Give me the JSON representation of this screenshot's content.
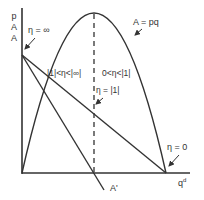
{
  "figure": {
    "type": "elasticity-along-demand-and-revenue",
    "axes": {
      "y_labels": [
        "p",
        "A",
        "A"
      ],
      "x_label": "q",
      "x_label_superscript": "d"
    },
    "curves": {
      "revenue_curve_label": "A = pq"
    },
    "annotations": {
      "eta_infinity": "η = ∞",
      "eta_elastic_range": "|1|<η<|∞|",
      "eta_inelastic_range": "0<η<|1|",
      "eta_unit": "η = |1|",
      "eta_zero": "η = 0",
      "marginal_line_label": "A'"
    },
    "colors": {
      "line": "#333333",
      "text": "#333333",
      "background": "#ffffff"
    }
  }
}
